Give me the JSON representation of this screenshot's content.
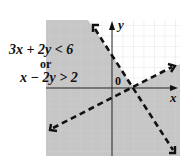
{
  "graph": {
    "inequality_1": "3x + 2y < 6",
    "connector": "or",
    "inequality_2": "x − 2y > 2",
    "x_axis_label": "x",
    "y_axis_label": "y",
    "origin_label": "0"
  },
  "colors": {
    "shade": "#c8c8c8",
    "grid": "#dcdcdc",
    "line": "#111111",
    "background": "#ffffff"
  }
}
